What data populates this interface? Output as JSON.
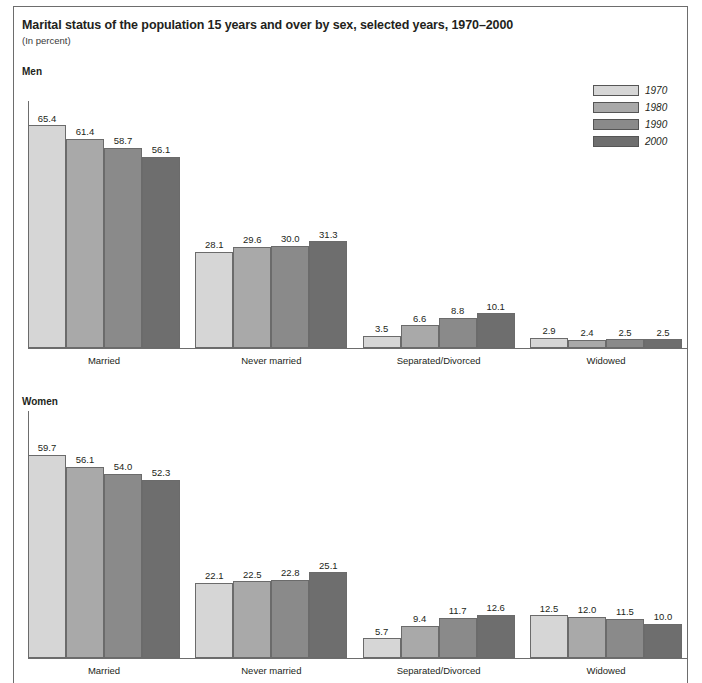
{
  "figure": {
    "title": "Marital status of the population 15 years and over by sex, selected years, 1970–2000",
    "subtitle": "(In percent)",
    "panel_men_label": "Men",
    "panel_women_label": "Women"
  },
  "legend": {
    "position": "top-right",
    "entries": [
      {
        "label": "1970",
        "color": "#d6d6d6"
      },
      {
        "label": "1980",
        "color": "#a9a9a9"
      },
      {
        "label": "1990",
        "color": "#8a8a8a"
      },
      {
        "label": "2000",
        "color": "#6e6e6e"
      }
    ]
  },
  "chart_data": [
    {
      "type": "bar",
      "title": "Men",
      "subtitle": "(In percent)",
      "xlabel": "",
      "ylabel": "",
      "ylim": [
        0,
        70
      ],
      "grid": false,
      "legend_position": "top-right",
      "categories": [
        "Married",
        "Never married",
        "Separated/Divorced",
        "Widowed"
      ],
      "series": [
        {
          "name": "1970",
          "color": "#d6d6d6",
          "values": [
            65.4,
            28.1,
            3.5,
            2.9
          ]
        },
        {
          "name": "1980",
          "color": "#a9a9a9",
          "values": [
            61.4,
            29.6,
            6.6,
            2.4
          ]
        },
        {
          "name": "1990",
          "color": "#8a8a8a",
          "values": [
            58.7,
            30.0,
            8.8,
            2.5
          ]
        },
        {
          "name": "2000",
          "color": "#6e6e6e",
          "values": [
            56.1,
            31.3,
            10.1,
            2.5
          ]
        }
      ]
    },
    {
      "type": "bar",
      "title": "Women",
      "subtitle": "(In percent)",
      "xlabel": "",
      "ylabel": "",
      "ylim": [
        0,
        70
      ],
      "grid": false,
      "legend_position": "top-right",
      "categories": [
        "Married",
        "Never married",
        "Separated/Divorced",
        "Widowed"
      ],
      "series": [
        {
          "name": "1970",
          "color": "#d6d6d6",
          "values": [
            59.7,
            22.1,
            5.7,
            12.5
          ]
        },
        {
          "name": "1980",
          "color": "#a9a9a9",
          "values": [
            56.1,
            22.5,
            9.4,
            12.0
          ]
        },
        {
          "name": "1990",
          "color": "#8a8a8a",
          "values": [
            54.0,
            22.8,
            11.7,
            11.5
          ]
        },
        {
          "name": "2000",
          "color": "#6e6e6e",
          "values": [
            52.3,
            25.1,
            12.6,
            10.0
          ]
        }
      ]
    }
  ]
}
